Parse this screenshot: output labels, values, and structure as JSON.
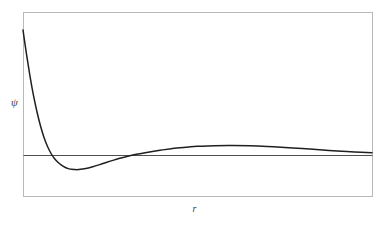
{
  "figure": {
    "name": "radial-wavefunction-plot",
    "background_color": "#ffffff",
    "frame": {
      "color": "#b8b8b8",
      "line_width": 1,
      "x": 23,
      "y": 12,
      "width": 349,
      "height": 184
    },
    "zero_line": {
      "color": "#4f4f4f",
      "line_width": 1,
      "y": 155
    },
    "curve": {
      "color": "#1f1f1f",
      "line_width": 1.5
    }
  },
  "labels": {
    "y_axis": "ψ",
    "x_axis": "r"
  },
  "chart_data": {
    "type": "line",
    "title": "",
    "subtitle": "",
    "xlabel": "r",
    "ylabel": "ψ",
    "grid": false,
    "legend": null,
    "axis_ticks": {
      "x": [],
      "y": []
    },
    "xlim": [
      0,
      10
    ],
    "ylim": [
      -0.25,
      1.1
    ],
    "annotations": [
      {
        "name": "zero-reference-line",
        "type": "hline",
        "y": 0
      }
    ],
    "series": [
      {
        "name": "psi",
        "color": "#1f1f1f",
        "x": [
          0.0,
          0.1,
          0.2,
          0.3,
          0.4,
          0.5,
          0.6,
          0.7,
          0.8,
          0.9,
          1.0,
          1.1,
          1.2,
          1.3,
          1.4,
          1.5,
          1.6,
          1.8,
          2.0,
          2.2,
          2.4,
          2.6,
          2.8,
          3.0,
          3.25,
          3.5,
          3.75,
          4.0,
          4.25,
          4.5,
          4.75,
          5.0,
          5.5,
          6.0,
          6.5,
          7.0,
          7.5,
          8.0,
          8.5,
          9.0,
          9.5,
          10.0
        ],
        "y": [
          0.855,
          0.69,
          0.54,
          0.408,
          0.296,
          0.2,
          0.122,
          0.06,
          0.012,
          -0.024,
          -0.05,
          -0.07,
          -0.084,
          -0.093,
          -0.098,
          -0.1,
          -0.099,
          -0.092,
          -0.08,
          -0.066,
          -0.05,
          -0.035,
          -0.021,
          -0.008,
          0.005,
          0.016,
          0.026,
          0.035,
          0.043,
          0.05,
          0.055,
          0.059,
          0.064,
          0.065,
          0.063,
          0.058,
          0.051,
          0.044,
          0.036,
          0.028,
          0.021,
          0.015
        ]
      }
    ],
    "features": {
      "start_value": 0.855,
      "first_zero_crossing_x": 0.83,
      "minimum": {
        "x": 1.52,
        "y": -0.1
      },
      "second_zero_crossing_x": 3.12,
      "maximum": {
        "x": 6.05,
        "y": 0.066
      },
      "asymptote": 0.0
    }
  }
}
